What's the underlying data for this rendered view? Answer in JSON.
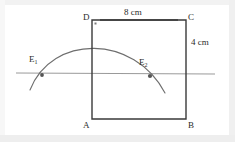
{
  "figure": {
    "kind": "geometry-construction-diagram",
    "colors": {
      "square_stroke": "#3a3a3a",
      "arc_stroke": "#6e6e6e",
      "line_stroke": "#9a9a9a",
      "text": "#2b2b2b",
      "background": "#ffffff",
      "frame": "#f2f2f2"
    },
    "square": {
      "vertices": [
        {
          "name": "D",
          "label": "D",
          "x": 92,
          "y": 20,
          "label_x": 83,
          "label_y": 13
        },
        {
          "name": "C",
          "label": "C",
          "x": 186,
          "y": 20,
          "label_x": 188,
          "label_y": 13
        },
        {
          "name": "B",
          "label": "B",
          "x": 186,
          "y": 119,
          "label_x": 188,
          "label_y": 121
        },
        {
          "name": "A",
          "label": "A",
          "x": 92,
          "y": 119,
          "label_x": 83,
          "label_y": 121
        }
      ],
      "dimensions": [
        {
          "name": "top-edge",
          "label": "8 cm",
          "side": "top"
        },
        {
          "name": "right-edge",
          "label": "4 cm",
          "side": "right"
        }
      ]
    },
    "horizontal_line": {
      "x1": 16,
      "y1": 73,
      "x2": 215,
      "y2": 74
    },
    "arc": {
      "start_x": 30,
      "start_y": 90,
      "ctrl1_x": 52,
      "ctrl1_y": 34,
      "ctrl2_x": 134,
      "ctrl2_y": 34,
      "end_x": 165,
      "end_y": 93,
      "peak_x": 95,
      "peak_y": 42
    },
    "intersections": [
      {
        "name": "E1",
        "label": "E",
        "sub": "1",
        "x": 42,
        "y": 75,
        "label_x": 29,
        "label_y": 55
      },
      {
        "name": "E2",
        "label": "E",
        "sub": "2",
        "x": 150,
        "y": 76,
        "label_x": 139,
        "label_y": 58
      }
    ]
  }
}
